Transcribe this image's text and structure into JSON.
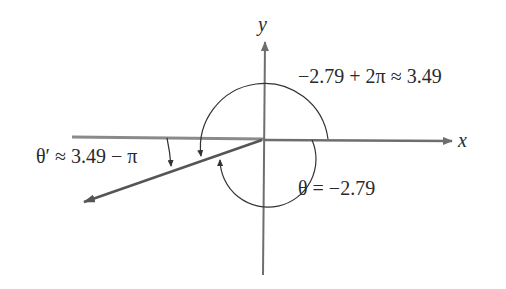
{
  "diagram": {
    "type": "angle-in-standard-position",
    "axes": {
      "x_label": "x",
      "y_label": "y"
    },
    "labels": {
      "coterminal": "−2.79 + 2π ≈ 3.49",
      "theta": "θ = −2.79",
      "theta_prime": "θ′ ≈ 3.49 − π"
    },
    "angles": {
      "theta_radians": -2.79,
      "coterminal_radians": 3.49,
      "reference_angle_expression": "3.49 − π"
    },
    "colors": {
      "axis": "#6e6e6e",
      "ray": "#555555",
      "arc": "#333333",
      "text": "#2a2a2a",
      "background": "#ffffff"
    }
  }
}
